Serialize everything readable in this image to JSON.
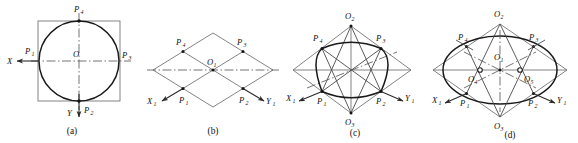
{
  "figure": {
    "panel_count": 4,
    "background_color": "#ffffff",
    "line_color": "#1a1a1a",
    "thin_line_color": "#4a4a4a",
    "centerline_color": "#5a5a5a"
  },
  "panels": [
    {
      "id": "a",
      "caption": "(a)",
      "description": "Front view: circle inscribed in a square with orthogonal centre lines",
      "shapes": [
        "square",
        "circle",
        "horizontal-centerline",
        "vertical-centerline"
      ],
      "axes": [
        {
          "name": "X",
          "label": "X",
          "direction": "left"
        },
        {
          "name": "Y",
          "label": "Y",
          "direction": "down"
        }
      ],
      "points": [
        {
          "name": "O",
          "label": "O",
          "sub": "",
          "position": "center"
        },
        {
          "name": "P1",
          "label": "P",
          "sub": "1",
          "position": "left"
        },
        {
          "name": "P2",
          "label": "P",
          "sub": "2",
          "position": "bottom"
        },
        {
          "name": "P3",
          "label": "P",
          "sub": "3",
          "position": "right"
        },
        {
          "name": "P4",
          "label": "P",
          "sub": "4",
          "position": "top"
        }
      ]
    },
    {
      "id": "b",
      "caption": "(b)",
      "description": "Isometric projection of the square becomes a rhombus with midpoint lines",
      "shapes": [
        "rhombus",
        "midline-horizontal",
        "midline-vertical",
        "diagonal-centerline"
      ],
      "axes": [
        {
          "name": "X1",
          "label": "X",
          "sub": "1",
          "direction": "lower-left"
        },
        {
          "name": "Y1",
          "label": "Y",
          "sub": "1",
          "direction": "lower-right"
        }
      ],
      "points": [
        {
          "name": "O1",
          "label": "O",
          "sub": "1",
          "position": "center"
        },
        {
          "name": "P1",
          "label": "P",
          "sub": "1",
          "position": "lower-left-mid"
        },
        {
          "name": "P2",
          "label": "P",
          "sub": "2",
          "position": "lower-right-mid"
        },
        {
          "name": "P3",
          "label": "P",
          "sub": "3",
          "position": "upper-right-mid"
        },
        {
          "name": "P4",
          "label": "P",
          "sub": "4",
          "position": "upper-left-mid"
        }
      ]
    },
    {
      "id": "c",
      "caption": "(c)",
      "description": "Locating arc centres: lines from the obtuse vertices O2 and O3 to the opposite midpoints P1..P4",
      "shapes": [
        "rhombus",
        "construction-lines",
        "large-arcs",
        "centerline"
      ],
      "axes": [
        {
          "name": "X1",
          "label": "X",
          "sub": "1",
          "direction": "lower-left"
        },
        {
          "name": "Y1",
          "label": "Y",
          "sub": "1",
          "direction": "lower-right"
        }
      ],
      "points": [
        {
          "name": "O2",
          "label": "O",
          "sub": "2",
          "position": "top-vertex"
        },
        {
          "name": "O3",
          "label": "O",
          "sub": "3",
          "position": "bottom-vertex"
        },
        {
          "name": "P1",
          "label": "P",
          "sub": "1",
          "position": "lower-left-mid"
        },
        {
          "name": "P2",
          "label": "P",
          "sub": "2",
          "position": "lower-right-mid"
        },
        {
          "name": "P3",
          "label": "P",
          "sub": "3",
          "position": "upper-right-mid"
        },
        {
          "name": "P4",
          "label": "P",
          "sub": "4",
          "position": "upper-left-mid"
        }
      ]
    },
    {
      "id": "d",
      "caption": "(d)",
      "description": "Completed four-centre ellipse inscribed in the rhombus; O4 and O5 are the small-arc centres",
      "shapes": [
        "rhombus",
        "ellipse",
        "construction-lines",
        "centerline"
      ],
      "axes": [
        {
          "name": "X1",
          "label": "X",
          "sub": "1",
          "direction": "lower-left"
        },
        {
          "name": "Y1",
          "label": "Y",
          "sub": "1",
          "direction": "lower-right"
        }
      ],
      "points": [
        {
          "name": "O1",
          "label": "O",
          "sub": "1",
          "position": "center"
        },
        {
          "name": "O2",
          "label": "O",
          "sub": "2",
          "position": "top-vertex"
        },
        {
          "name": "O3",
          "label": "O",
          "sub": "3",
          "position": "bottom-vertex"
        },
        {
          "name": "O4",
          "label": "O",
          "sub": "4",
          "position": "left-inner"
        },
        {
          "name": "O5",
          "label": "O",
          "sub": "5",
          "position": "right-inner"
        },
        {
          "name": "P1",
          "label": "P",
          "sub": "1",
          "position": "lower-left-mid"
        },
        {
          "name": "P2",
          "label": "P",
          "sub": "2",
          "position": "lower-right-mid"
        },
        {
          "name": "P3",
          "label": "P",
          "sub": "3",
          "position": "upper-right-mid"
        },
        {
          "name": "P4",
          "label": "P",
          "sub": "4",
          "position": "upper-left-mid"
        }
      ]
    }
  ]
}
